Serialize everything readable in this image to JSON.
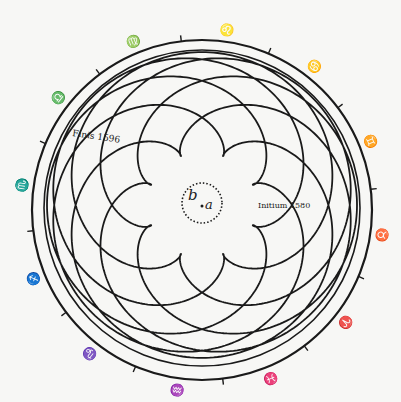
{
  "diagram": {
    "title": "",
    "center_labels": {
      "b": "b",
      "a": "a"
    },
    "annotations": {
      "finis": "Finis 1596",
      "initium": "Initium 1580"
    },
    "zodiac_signs": [
      {
        "glyph": "♍",
        "name": "virgo"
      },
      {
        "glyph": "♌",
        "name": "leo"
      },
      {
        "glyph": "♋",
        "name": "cancer"
      },
      {
        "glyph": "♊",
        "name": "gemini"
      },
      {
        "glyph": "♉",
        "name": "taurus"
      },
      {
        "glyph": "♈",
        "name": "aries"
      },
      {
        "glyph": "♓",
        "name": "pisces"
      },
      {
        "glyph": "♒",
        "name": "aquarius"
      },
      {
        "glyph": "♑",
        "name": "capricorn"
      },
      {
        "glyph": "♐",
        "name": "sagittarius"
      },
      {
        "glyph": "♏",
        "name": "scorpio"
      },
      {
        "glyph": "♎",
        "name": "libra"
      }
    ],
    "colors": {
      "ink": "#1a1a1a",
      "paper": "#f7f7f5"
    }
  }
}
